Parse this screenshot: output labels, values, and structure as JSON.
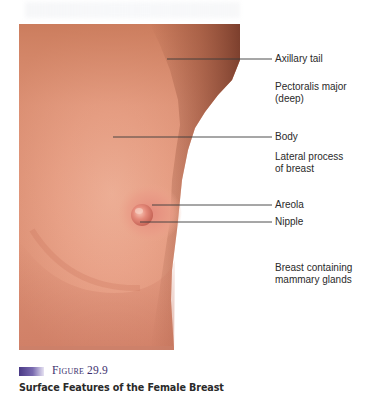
{
  "figure": {
    "number_label": "Figure 29.9",
    "title": "Surface Features of the Female Breast",
    "caption_bar_color": "#4a3a86"
  },
  "image": {
    "subject": "photograph of female breast, lateral-front view",
    "skin_tone_light": "#e8a58a",
    "skin_tone_mid": "#d08a6e",
    "skin_tone_shadow": "#8e4a34"
  },
  "labels": [
    {
      "id": "axillary-tail",
      "text": "Axillary tail",
      "line_y": 59,
      "line_x_start": 167,
      "line_color": "#3a3a3a",
      "text_top": 53
    },
    {
      "id": "pectoralis-major",
      "text": "Pectoralis major\n(deep)",
      "line_y": 87,
      "line_x_start": 85,
      "line_color": "#3a3a7a",
      "text_top": 81
    },
    {
      "id": "body",
      "text": "Body",
      "line_y": 137,
      "line_x_start": 113,
      "line_color": "#3a3a3a",
      "text_top": 131
    },
    {
      "id": "lateral-process",
      "text": "Lateral process\nof breast",
      "line_y": 157,
      "line_x_start": 183,
      "line_color": "#58c060",
      "text_top": 151
    },
    {
      "id": "areola",
      "text": "Areola",
      "line_y": 205,
      "line_x_start": 152,
      "line_color": "#3a3a3a",
      "text_top": 199
    },
    {
      "id": "nipple",
      "text": "Nipple",
      "line_y": 222,
      "line_x_start": 140,
      "line_color": "#3a3a3a",
      "text_top": 216
    },
    {
      "id": "breast-mammary",
      "text": "Breast containing\nmammary glands",
      "line_y": 268,
      "line_x_start": 125,
      "line_color": "#c0506a",
      "text_top": 262
    }
  ]
}
